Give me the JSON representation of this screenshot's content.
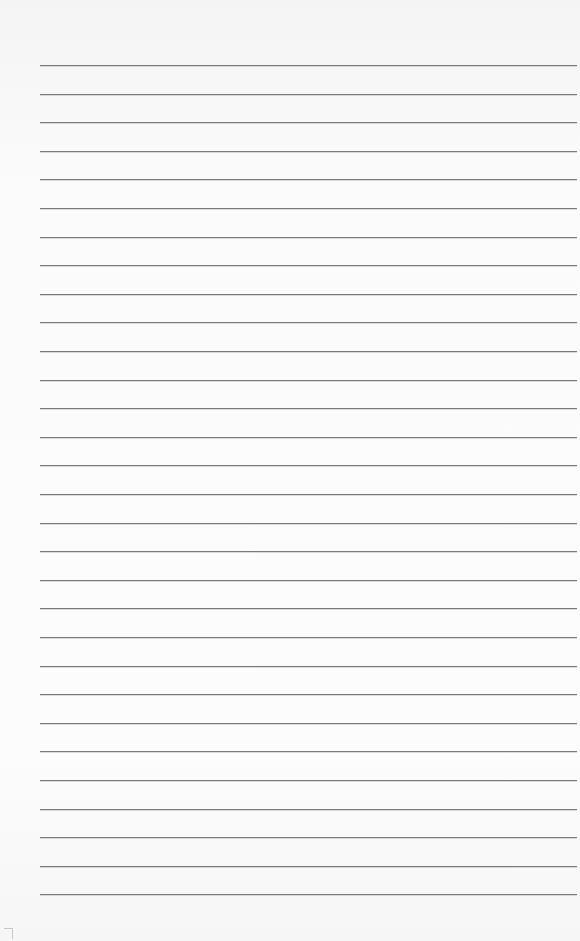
{
  "page": {
    "type": "lined-paper",
    "background_color": "#fafafa",
    "rule_color": "#7a7a7a",
    "rule_count": 30,
    "first_rule_y": 65,
    "rule_spacing": 28.6,
    "rule_left": 40,
    "rule_right": 577
  }
}
